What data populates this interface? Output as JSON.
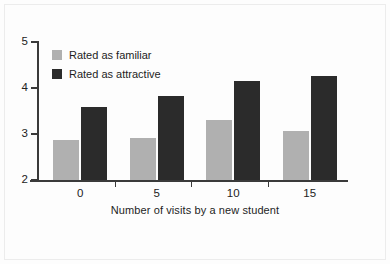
{
  "chart_data": {
    "type": "bar",
    "title": "",
    "xlabel": "Number of visits by a new student",
    "ylabel": "",
    "categories": [
      "0",
      "5",
      "10",
      "15"
    ],
    "ylim": [
      2,
      5
    ],
    "yticks": [
      "2",
      "3",
      "4",
      "5"
    ],
    "grid": false,
    "legend_position": "top-left",
    "series": [
      {
        "name": "Rated as familiar",
        "color": "#b0b0b0",
        "values": [
          2.87,
          2.91,
          3.3,
          3.07
        ]
      },
      {
        "name": "Rated as attractive",
        "color": "#2b2b2b",
        "values": [
          3.59,
          3.83,
          4.15,
          4.26
        ]
      }
    ]
  },
  "legend": {
    "items": [
      {
        "label": "Rated as familiar",
        "swatch": "familiar"
      },
      {
        "label": "Rated as attractive",
        "swatch": "attractive"
      }
    ]
  },
  "colors": {
    "familiar": "#b0b0b0",
    "attractive": "#2b2b2b",
    "axis": "#3a3a3a",
    "background": "#fdfdfd"
  }
}
